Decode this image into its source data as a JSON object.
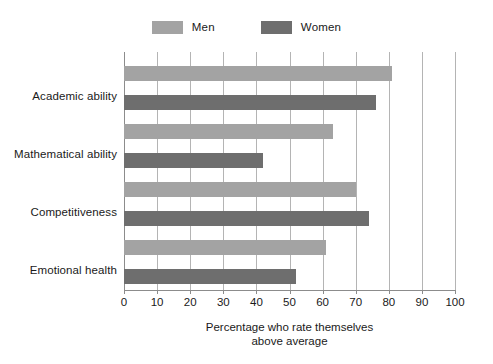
{
  "chart_data": {
    "type": "bar",
    "orientation": "horizontal",
    "title": "",
    "subtitle": "",
    "xlabel_line1": "Percentage who rate themselves",
    "xlabel_line2": "above average",
    "ylabel": "",
    "categories": [
      "Academic ability",
      "Mathematical ability",
      "Competitiveness",
      "Emotional health"
    ],
    "series": [
      {
        "name": "Men",
        "color": "#a3a3a3",
        "values": [
          81,
          63,
          70,
          61
        ]
      },
      {
        "name": "Women",
        "color": "#6e6e6e",
        "values": [
          76,
          42,
          74,
          52
        ]
      }
    ],
    "xlim": [
      0,
      100
    ],
    "xticks": [
      0,
      10,
      20,
      30,
      40,
      50,
      60,
      70,
      80,
      90,
      100
    ],
    "xtick_labels": [
      "0",
      "10",
      "20",
      "30",
      "40",
      "50",
      "60",
      "70",
      "80",
      "90",
      "100"
    ],
    "grid": "vertical",
    "grid_color": "#b4b4b4",
    "legend_position": "top-center"
  },
  "legend": {
    "entries": [
      {
        "label": "Men",
        "color": "#a3a3a3"
      },
      {
        "label": "Women",
        "color": "#6e6e6e"
      }
    ]
  },
  "axis": {
    "x_title_line1": "Percentage who rate themselves",
    "x_title_line2": "above average"
  }
}
